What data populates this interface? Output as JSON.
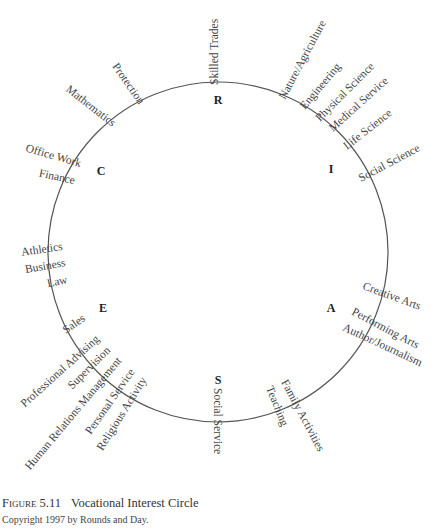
{
  "caption": {
    "figure_label": "Figure 5.11",
    "title": "Vocational Interest Circle",
    "copyright": "Copyright 1997 by Rounds and Day."
  },
  "types": [
    {
      "code": "R",
      "name": "Realistic"
    },
    {
      "code": "I",
      "name": "Investigative"
    },
    {
      "code": "A",
      "name": "Artistic"
    },
    {
      "code": "S",
      "name": "Social"
    },
    {
      "code": "E",
      "name": "Enterprising"
    },
    {
      "code": "C",
      "name": "Conventional"
    }
  ],
  "labels": [
    {
      "text": "Skilled Trades"
    },
    {
      "text": "Nature/Agriculture"
    },
    {
      "text": "Engineering"
    },
    {
      "text": "Physical Science"
    },
    {
      "text": "Medical Service"
    },
    {
      "text": "Life Science"
    },
    {
      "text": "Social Science"
    },
    {
      "text": "Creative Arts"
    },
    {
      "text": "Performing Arts"
    },
    {
      "text": "Author/Journalism"
    },
    {
      "text": "Family Activities"
    },
    {
      "text": "Teaching"
    },
    {
      "text": "Social Service"
    },
    {
      "text": "Religious Activity"
    },
    {
      "text": "Personal Service"
    },
    {
      "text": "Human Relations Management"
    },
    {
      "text": "Supervision"
    },
    {
      "text": "Professional Advising"
    },
    {
      "text": "Sales"
    },
    {
      "text": "Law"
    },
    {
      "text": "Business"
    },
    {
      "text": "Athletics"
    },
    {
      "text": "Finance"
    },
    {
      "text": "Office Work"
    },
    {
      "text": "Mathematics"
    },
    {
      "text": "Protection"
    }
  ]
}
